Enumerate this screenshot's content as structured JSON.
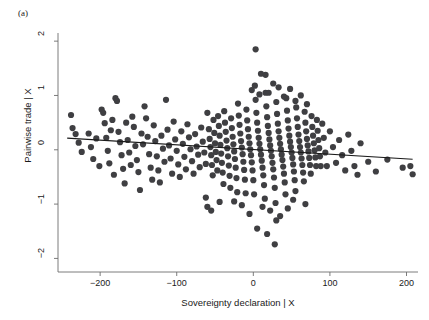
{
  "figure": {
    "panel_label": "(a)",
    "type": "added-variable-plot"
  },
  "chart_data": {
    "type": "scatter",
    "title": "",
    "subtitle": "",
    "xlabel": "Sovereignty declaration | X",
    "ylabel": "Pairwise trade | X",
    "xlim": [
      -255,
      215
    ],
    "ylim": [
      -2.25,
      2.15
    ],
    "xticks": [
      -200,
      -100,
      0,
      100,
      200
    ],
    "xticklabels": [
      "-200",
      "-100",
      "0",
      "100",
      "200"
    ],
    "yticks": [
      -2,
      -1,
      0,
      1,
      2
    ],
    "yticklabels": [
      "-2",
      "-1",
      "0",
      "1",
      "2"
    ],
    "grid": false,
    "legend": null,
    "marker_color": "#3f3f42",
    "marker_size": 3.1,
    "fitline": {
      "type": "linear",
      "color": "#1a1a1a",
      "x_start": -243,
      "y_start": 0.215,
      "x_end": 208,
      "y_end": -0.175,
      "slope": -0.000865,
      "intercept": 0.0048
    },
    "n_points": 520,
    "points": [
      [
        -238,
        0.64
      ],
      [
        -236,
        0.4
      ],
      [
        -232,
        0.29
      ],
      [
        -228,
        0.13
      ],
      [
        -224,
        -0.04
      ],
      [
        -215,
        0.3
      ],
      [
        -212,
        0.05
      ],
      [
        -209,
        -0.17
      ],
      [
        -205,
        0.21
      ],
      [
        -201,
        -0.3
      ],
      [
        -198,
        0.74
      ],
      [
        -196,
        0.68
      ],
      [
        -194,
        0.49
      ],
      [
        -192,
        0.22
      ],
      [
        -190,
        -0.02
      ],
      [
        -188,
        -0.25
      ],
      [
        -186,
        0.36
      ],
      [
        -184,
        0.55
      ],
      [
        -182,
        -0.46
      ],
      [
        -180,
        0.95
      ],
      [
        -178,
        0.9
      ],
      [
        -176,
        0.33
      ],
      [
        -174,
        0.14
      ],
      [
        -172,
        -0.1
      ],
      [
        -170,
        -0.35
      ],
      [
        -168,
        -0.62
      ],
      [
        -166,
        0.5
      ],
      [
        -164,
        0.18
      ],
      [
        -162,
        -0.05
      ],
      [
        -160,
        -0.28
      ],
      [
        -158,
        0.61
      ],
      [
        -156,
        0.42
      ],
      [
        -154,
        0.07
      ],
      [
        -152,
        -0.19
      ],
      [
        -150,
        -0.41
      ],
      [
        -148,
        -0.74
      ],
      [
        -146,
        0.3
      ],
      [
        -144,
        0.1
      ],
      [
        -142,
        0.8
      ],
      [
        -140,
        0.58
      ],
      [
        -138,
        0.24
      ],
      [
        -136,
        -0.08
      ],
      [
        -134,
        -0.33
      ],
      [
        -132,
        -0.55
      ],
      [
        -130,
        0.45
      ],
      [
        -128,
        0.16
      ],
      [
        -126,
        -0.12
      ],
      [
        -124,
        -0.38
      ],
      [
        -122,
        -0.6
      ],
      [
        -120,
        0.26
      ],
      [
        -118,
        0.02
      ],
      [
        -116,
        -0.22
      ],
      [
        -114,
        0.92
      ],
      [
        -112,
        0.37
      ],
      [
        -110,
        0.08
      ],
      [
        -108,
        -0.16
      ],
      [
        -106,
        -0.44
      ],
      [
        -104,
        0.52
      ],
      [
        -102,
        0.19
      ],
      [
        -100,
        -0.02
      ],
      [
        -98,
        -0.27
      ],
      [
        -96,
        -0.5
      ],
      [
        -94,
        0.34
      ],
      [
        -92,
        0.11
      ],
      [
        -90,
        -0.13
      ],
      [
        -88,
        -0.36
      ],
      [
        -86,
        0.47
      ],
      [
        -84,
        0.23
      ],
      [
        -82,
        0.01
      ],
      [
        -80,
        -0.21
      ],
      [
        -78,
        -0.44
      ],
      [
        -76,
        0.29
      ],
      [
        -74,
        0.06
      ],
      [
        -72,
        -0.09
      ],
      [
        -70,
        -0.32
      ],
      [
        -68,
        0.41
      ],
      [
        -66,
        0.15
      ],
      [
        -64,
        -0.05
      ],
      [
        -62,
        -0.26
      ],
      [
        -60,
        0.68
      ],
      [
        -58,
        0.38
      ],
      [
        -57,
        0.2
      ],
      [
        -56,
        0.05
      ],
      [
        -55,
        -0.1
      ],
      [
        -54,
        -0.28
      ],
      [
        -53,
        -0.47
      ],
      [
        -52,
        0.55
      ],
      [
        -51,
        0.31
      ],
      [
        -50,
        0.12
      ],
      [
        -49,
        -0.04
      ],
      [
        -48,
        -0.19
      ],
      [
        -47,
        -0.38
      ],
      [
        -46,
        0.62
      ],
      [
        -45,
        0.44
      ],
      [
        -44,
        0.26
      ],
      [
        -43,
        0.09
      ],
      [
        -42,
        -0.07
      ],
      [
        -41,
        -0.24
      ],
      [
        -40,
        -0.42
      ],
      [
        -39,
        -0.63
      ],
      [
        -38,
        0.71
      ],
      [
        -37,
        0.5
      ],
      [
        -36,
        0.33
      ],
      [
        -35,
        0.17
      ],
      [
        -34,
        0.03
      ],
      [
        -33,
        -0.12
      ],
      [
        -32,
        -0.29
      ],
      [
        -31,
        -0.48
      ],
      [
        -30,
        -0.7
      ],
      [
        -29,
        0.58
      ],
      [
        -28,
        0.4
      ],
      [
        -27,
        0.24
      ],
      [
        -26,
        0.1
      ],
      [
        -25,
        -0.03
      ],
      [
        -24,
        -0.17
      ],
      [
        -23,
        -0.33
      ],
      [
        -22,
        -0.52
      ],
      [
        -21,
        -0.78
      ],
      [
        -20,
        0.85
      ],
      [
        -19,
        0.63
      ],
      [
        -18,
        0.46
      ],
      [
        -17,
        0.3
      ],
      [
        -16,
        0.16
      ],
      [
        -15,
        0.04
      ],
      [
        -14,
        -0.08
      ],
      [
        -13,
        -0.22
      ],
      [
        -12,
        -0.37
      ],
      [
        -11,
        -0.55
      ],
      [
        -10,
        -0.8
      ],
      [
        -9,
        0.74
      ],
      [
        -8,
        0.54
      ],
      [
        -7,
        0.38
      ],
      [
        -6,
        0.24
      ],
      [
        -5,
        0.12
      ],
      [
        -4,
        0.01
      ],
      [
        -3,
        -0.1
      ],
      [
        -2,
        -0.23
      ],
      [
        -1,
        -0.38
      ],
      [
        0,
        -0.56
      ],
      [
        1,
        -0.82
      ],
      [
        2,
        1.18
      ],
      [
        3,
        0.92
      ],
      [
        4,
        0.68
      ],
      [
        5,
        0.5
      ],
      [
        6,
        0.35
      ],
      [
        7,
        0.22
      ],
      [
        8,
        0.11
      ],
      [
        9,
        0.01
      ],
      [
        10,
        -0.09
      ],
      [
        11,
        -0.2
      ],
      [
        12,
        -0.33
      ],
      [
        13,
        -0.47
      ],
      [
        14,
        -0.65
      ],
      [
        15,
        -0.9
      ],
      [
        16,
        1.05
      ],
      [
        17,
        0.8
      ],
      [
        18,
        0.6
      ],
      [
        19,
        0.44
      ],
      [
        20,
        0.31
      ],
      [
        21,
        0.19
      ],
      [
        22,
        0.08
      ],
      [
        23,
        -0.02
      ],
      [
        24,
        -0.12
      ],
      [
        25,
        -0.24
      ],
      [
        26,
        -0.36
      ],
      [
        27,
        -0.51
      ],
      [
        28,
        -0.7
      ],
      [
        29,
        -0.98
      ],
      [
        30,
        0.88
      ],
      [
        31,
        0.66
      ],
      [
        32,
        0.48
      ],
      [
        33,
        0.34
      ],
      [
        34,
        0.22
      ],
      [
        35,
        0.11
      ],
      [
        36,
        0.01
      ],
      [
        37,
        -0.09
      ],
      [
        38,
        -0.19
      ],
      [
        39,
        -0.31
      ],
      [
        40,
        -0.44
      ],
      [
        41,
        -0.6
      ],
      [
        42,
        -0.82
      ],
      [
        43,
        0.95
      ],
      [
        44,
        0.72
      ],
      [
        45,
        0.54
      ],
      [
        46,
        0.39
      ],
      [
        47,
        0.26
      ],
      [
        48,
        0.15
      ],
      [
        49,
        0.05
      ],
      [
        50,
        -0.05
      ],
      [
        51,
        -0.15
      ],
      [
        52,
        -0.27
      ],
      [
        53,
        -0.4
      ],
      [
        54,
        -0.56
      ],
      [
        55,
        -0.76
      ],
      [
        56,
        0.78
      ],
      [
        57,
        0.58
      ],
      [
        58,
        0.42
      ],
      [
        59,
        0.28
      ],
      [
        60,
        0.16
      ],
      [
        61,
        0.05
      ],
      [
        62,
        -0.05
      ],
      [
        63,
        -0.16
      ],
      [
        64,
        -0.28
      ],
      [
        65,
        -0.42
      ],
      [
        66,
        -0.58
      ],
      [
        67,
        0.7
      ],
      [
        68,
        0.5
      ],
      [
        69,
        0.34
      ],
      [
        70,
        0.2
      ],
      [
        71,
        0.08
      ],
      [
        72,
        -0.03
      ],
      [
        73,
        -0.15
      ],
      [
        74,
        -0.28
      ],
      [
        75,
        -0.44
      ],
      [
        76,
        0.62
      ],
      [
        77,
        0.42
      ],
      [
        78,
        0.26
      ],
      [
        79,
        0.12
      ],
      [
        80,
        -0.01
      ],
      [
        81,
        -0.14
      ],
      [
        82,
        -0.3
      ],
      [
        83,
        0.55
      ],
      [
        84,
        0.35
      ],
      [
        85,
        0.18
      ],
      [
        86,
        0.03
      ],
      [
        87,
        -0.12
      ],
      [
        88,
        -0.3
      ],
      [
        90,
        0.48
      ],
      [
        92,
        0.22
      ],
      [
        94,
        -0.05
      ],
      [
        96,
        -0.3
      ],
      [
        100,
        0.34
      ],
      [
        104,
        0.05
      ],
      [
        108,
        -0.24
      ],
      [
        112,
        0.18
      ],
      [
        116,
        -0.1
      ],
      [
        120,
        -0.38
      ],
      [
        124,
        0.28
      ],
      [
        128,
        -0.02
      ],
      [
        132,
        -0.3
      ],
      [
        136,
        -0.46
      ],
      [
        140,
        0.12
      ],
      [
        150,
        -0.22
      ],
      [
        160,
        -0.4
      ],
      [
        175,
        -0.18
      ],
      [
        195,
        -0.33
      ],
      [
        205,
        -0.3
      ],
      [
        208,
        -0.45
      ],
      [
        3,
        1.85
      ],
      [
        10,
        1.4
      ],
      [
        16,
        1.38
      ],
      [
        26,
        1.22
      ],
      [
        33,
        1.15
      ],
      [
        -2,
        1.1
      ],
      [
        8,
        1.02
      ],
      [
        20,
        1.05
      ],
      [
        40,
        0.98
      ],
      [
        48,
        1.12
      ],
      [
        55,
        0.9
      ],
      [
        62,
        1.0
      ],
      [
        70,
        0.84
      ],
      [
        12,
        -1.05
      ],
      [
        22,
        -1.12
      ],
      [
        30,
        -1.3
      ],
      [
        5,
        -1.45
      ],
      [
        18,
        -1.55
      ],
      [
        35,
        -1.22
      ],
      [
        45,
        -1.08
      ],
      [
        -5,
        -1.18
      ],
      [
        -15,
        -1.02
      ],
      [
        -25,
        -0.95
      ],
      [
        28,
        -1.74
      ],
      [
        52,
        -0.92
      ],
      [
        68,
        -1.0
      ],
      [
        -60,
        -1.05
      ],
      [
        -55,
        -1.12
      ],
      [
        -62,
        -0.88
      ],
      [
        -44,
        -0.96
      ]
    ]
  }
}
